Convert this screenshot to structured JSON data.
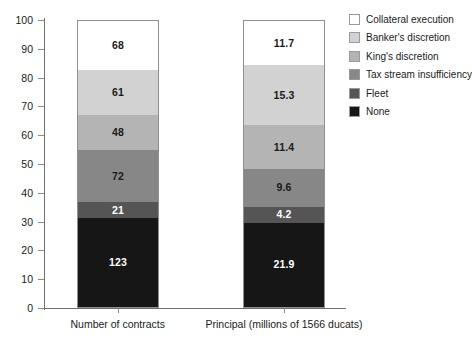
{
  "chart_data": {
    "type": "bar",
    "subtype": "stacked-100-percent",
    "title": "",
    "xlabel": "",
    "ylabel": "",
    "ylim": [
      0,
      100
    ],
    "yticks": [
      0,
      10,
      20,
      30,
      40,
      50,
      60,
      70,
      80,
      90,
      100
    ],
    "ytick_labels": [
      "0",
      "10",
      "20",
      "30",
      "40",
      "50",
      "60",
      "70",
      "80",
      "90",
      "100"
    ],
    "grid": false,
    "legend_position": "right",
    "categories": [
      "Number of contracts",
      "Principal (millions of 1566 ducats)"
    ],
    "series": [
      {
        "name": "Collateral execution",
        "color": "#ffffff",
        "values": [
          68,
          11.7
        ],
        "labels": [
          "68",
          "11.7"
        ],
        "label_colors": [
          "#1a1a1a",
          "#1a1a1a"
        ],
        "percent": [
          16.6,
          15.8
        ]
      },
      {
        "name": "Banker's discretion",
        "color": "#d2d2d2",
        "values": [
          61,
          15.3
        ],
        "labels": [
          "61",
          "15.3"
        ],
        "label_colors": [
          "#1a1a1a",
          "#1a1a1a"
        ],
        "percent": [
          14.9,
          20.6
        ]
      },
      {
        "name": "King's discretion",
        "color": "#b4b4b4",
        "values": [
          48,
          11.4
        ],
        "labels": [
          "48",
          "11.4"
        ],
        "label_colors": [
          "#1a1a1a",
          "#1a1a1a"
        ],
        "percent": [
          11.7,
          15.4
        ]
      },
      {
        "name": "Tax stream insufficiency",
        "color": "#878787",
        "values": [
          72,
          9.6
        ],
        "labels": [
          "72",
          "9.6"
        ],
        "label_colors": [
          "#1a1a1a",
          "#1a1a1a"
        ],
        "percent": [
          17.6,
          13.0
        ]
      },
      {
        "name": "Fleet",
        "color": "#555555",
        "values": [
          21,
          4.2
        ],
        "labels": [
          "21",
          "4.2"
        ],
        "label_colors": [
          "#ffffff",
          "#ffffff"
        ],
        "percent": [
          5.1,
          5.7
        ]
      },
      {
        "name": "None",
        "color": "#161616",
        "values": [
          123,
          21.9
        ],
        "labels": [
          "123",
          "21.9"
        ],
        "label_colors": [
          "#ffffff",
          "#ffffff"
        ],
        "percent": [
          30.1,
          29.6
        ]
      }
    ],
    "totals": [
      409,
      74.1
    ]
  },
  "axis": {
    "y": {
      "ticks": [
        "100",
        "90",
        "80",
        "70",
        "60",
        "50",
        "40",
        "30",
        "20",
        "10",
        "0"
      ]
    },
    "x": {
      "labels": [
        "Number of contracts",
        "Principal (millions of 1566 ducats)"
      ]
    }
  },
  "legend": {
    "items": [
      {
        "label": "Collateral execution",
        "color": "#ffffff"
      },
      {
        "label": "Banker's discretion",
        "color": "#d2d2d2"
      },
      {
        "label": "King's discretion",
        "color": "#b4b4b4"
      },
      {
        "label": "Tax stream insufficiency",
        "color": "#878787"
      },
      {
        "label": "Fleet",
        "color": "#555555"
      },
      {
        "label": "None",
        "color": "#161616"
      }
    ]
  }
}
